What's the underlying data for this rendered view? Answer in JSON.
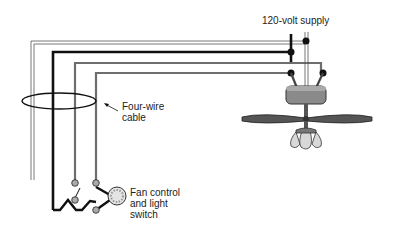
{
  "diagram": {
    "labels": {
      "supply": "120-volt supply",
      "cable_line1": "Four-wire",
      "cable_line2": "cable",
      "switch_line1": "Fan control",
      "switch_line2": "and light",
      "switch_line3": "switch"
    },
    "components": [
      "120-volt supply",
      "four-wire cable",
      "ceiling fan with light kit",
      "fan control and light switch"
    ],
    "colors": {
      "black_wire": "#111111",
      "gray_wire": "#6e6e6e",
      "white_wire_outline": "#555555",
      "fan_body": "#8a8a8a",
      "lamp_glass": "#d8d8d8"
    }
  }
}
